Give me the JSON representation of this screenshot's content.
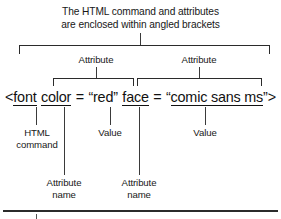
{
  "diagram": {
    "title_lines": [
      "The HTML command and attributes",
      "are enclosed within angled brackets"
    ],
    "code_line": {
      "full_text": "<font color = \"red\" face = \"comic sans ms\">",
      "open_angle": "<",
      "tag_name": "font",
      "attr1_name": "color",
      "equals1": "=",
      "quote_open1": "“",
      "attr1_value": "red",
      "quote_close1": "”",
      "attr2_name": "face",
      "equals2": "=",
      "quote_open2": "“",
      "attr2_value": "comic sans ms",
      "quote_close2": "”",
      "close_angle": ">"
    },
    "labels": {
      "attribute_1": "Attribute",
      "attribute_2": "Attribute",
      "html_command_line1": "HTML",
      "html_command_line2": "command",
      "value_1": "Value",
      "value_2": "Value",
      "attribute_name_1_line1": "Attribute",
      "attribute_name_1_line2": "name",
      "attribute_name_2_line1": "Attribute",
      "attribute_name_2_line2": "name"
    },
    "colors": {
      "ink": "#171717",
      "line": "#2b2b2b",
      "background": "#ffffff"
    }
  }
}
